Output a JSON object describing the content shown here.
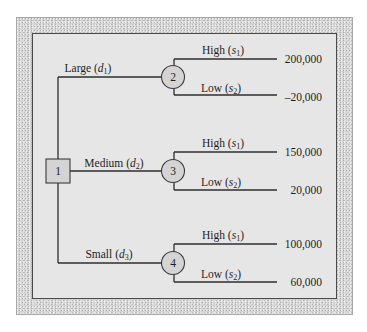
{
  "diagram": {
    "type": "decision-tree",
    "decision_node": {
      "id": "1",
      "shape": "square"
    },
    "branches": [
      {
        "decision_label": "Large",
        "decision_symbol": "d",
        "decision_sub": "1",
        "chance_node": "2",
        "outcomes": [
          {
            "label": "High",
            "symbol": "s",
            "sub": "1",
            "payoff": "200,000"
          },
          {
            "label": "Low",
            "symbol": "s",
            "sub": "2",
            "payoff": "–20,000"
          }
        ]
      },
      {
        "decision_label": "Medium",
        "decision_symbol": "d",
        "decision_sub": "2",
        "chance_node": "3",
        "outcomes": [
          {
            "label": "High",
            "symbol": "s",
            "sub": "1",
            "payoff": "150,000"
          },
          {
            "label": "Low",
            "symbol": "s",
            "sub": "2",
            "payoff": "20,000"
          }
        ]
      },
      {
        "decision_label": "Small",
        "decision_symbol": "d",
        "decision_sub": "3",
        "chance_node": "4",
        "outcomes": [
          {
            "label": "High",
            "symbol": "s",
            "sub": "1",
            "payoff": "100,000"
          },
          {
            "label": "Low",
            "symbol": "s",
            "sub": "2",
            "payoff": "60,000"
          }
        ]
      }
    ],
    "colors": {
      "frame": "#d6d6d6",
      "panel": "#e6e6e6",
      "node_fill": "#d4d4d4",
      "line": "#2e2e2e"
    }
  }
}
